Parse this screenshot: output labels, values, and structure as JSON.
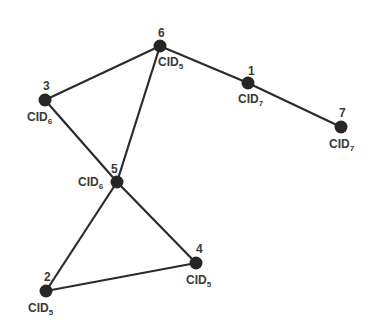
{
  "diagram": {
    "type": "graph",
    "nodes": [
      {
        "id": "1",
        "x": 248,
        "y": 83,
        "cid_prefix": "CID",
        "cid_sub": "7",
        "id_dx": 0,
        "id_dy": -8,
        "cid_dx": -10,
        "cid_dy": 20
      },
      {
        "id": "2",
        "x": 46,
        "y": 291,
        "cid_prefix": "CID",
        "cid_sub": "5",
        "id_dx": -2,
        "id_dy": -10,
        "cid_dx": -18,
        "cid_dy": 21
      },
      {
        "id": "3",
        "x": 45,
        "y": 100,
        "cid_prefix": "CID",
        "cid_sub": "6",
        "id_dx": -2,
        "id_dy": -10,
        "cid_dx": -18,
        "cid_dy": 21
      },
      {
        "id": "4",
        "x": 196,
        "y": 263,
        "cid_prefix": "CID",
        "cid_sub": "5",
        "id_dx": 0,
        "id_dy": -10,
        "cid_dx": -10,
        "cid_dy": 21
      },
      {
        "id": "5",
        "x": 117,
        "y": 182,
        "cid_prefix": "CID",
        "cid_sub": "6",
        "id_dx": -6,
        "id_dy": -9,
        "cid_dx": -39,
        "cid_dy": 4
      },
      {
        "id": "6",
        "x": 160,
        "y": 46,
        "cid_prefix": "CID",
        "cid_sub": "5",
        "id_dx": -2,
        "id_dy": -9,
        "cid_dx": -2,
        "cid_dy": 20
      },
      {
        "id": "7",
        "x": 341,
        "y": 127,
        "cid_prefix": "CID",
        "cid_sub": "7",
        "id_dx": -2,
        "id_dy": -10,
        "cid_dx": -12,
        "cid_dy": 21
      }
    ],
    "edges": [
      [
        "6",
        "3"
      ],
      [
        "6",
        "5"
      ],
      [
        "6",
        "1"
      ],
      [
        "1",
        "7"
      ],
      [
        "3",
        "5"
      ],
      [
        "5",
        "2"
      ],
      [
        "5",
        "4"
      ],
      [
        "2",
        "4"
      ]
    ],
    "node_color": "#262626",
    "edge_color": "#2b2b2b"
  }
}
